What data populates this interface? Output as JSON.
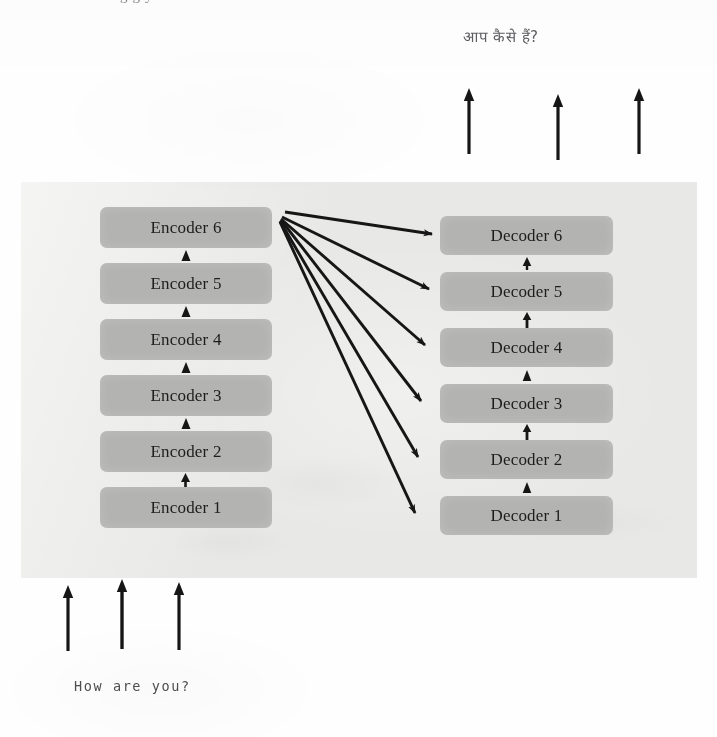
{
  "page": {
    "cutoff_text": "g      g  y",
    "width": 717,
    "height": 737
  },
  "output_sentence": {
    "text": "आप कैसे हैं?",
    "language": "Hindi",
    "meaning": "How are you?"
  },
  "input_sentence": {
    "text": "How are you?",
    "language": "English"
  },
  "colors": {
    "panel_background": "#e8e8e6",
    "block_fill": "#b3b3b2",
    "block_text": "#1d1d1d",
    "arrow": "#161616",
    "page_background": "#fefefe"
  },
  "diagram": {
    "type": "transformer-encoder-decoder-stack",
    "encoder_stack": {
      "label_prefix": "Encoder",
      "count": 6,
      "blocks": [
        {
          "label": "Encoder 6",
          "index": 6,
          "top": 0
        },
        {
          "label": "Encoder 5",
          "index": 5,
          "top": 56
        },
        {
          "label": "Encoder 4",
          "index": 4,
          "top": 112
        },
        {
          "label": "Encoder 3",
          "index": 3,
          "top": 168
        },
        {
          "label": "Encoder 2",
          "index": 2,
          "top": 224
        },
        {
          "label": "Encoder 1",
          "index": 1,
          "top": 280
        }
      ]
    },
    "decoder_stack": {
      "label_prefix": "Decoder",
      "count": 6,
      "blocks": [
        {
          "label": "Decoder 6",
          "index": 6,
          "top": 0
        },
        {
          "label": "Decoder 5",
          "index": 5,
          "top": 56
        },
        {
          "label": "Decoder 4",
          "index": 4,
          "top": 112
        },
        {
          "label": "Decoder 3",
          "index": 3,
          "top": 168
        },
        {
          "label": "Decoder 2",
          "index": 2,
          "top": 224
        },
        {
          "label": "Decoder 1",
          "index": 1,
          "top": 280
        }
      ]
    },
    "input_arrows": {
      "count": 3,
      "direction": "up",
      "positions_x": [
        67,
        121,
        178
      ],
      "top": 585,
      "length": 65
    },
    "output_arrows": {
      "count": 3,
      "direction": "up",
      "positions_x": [
        468,
        557,
        638
      ],
      "top": 88,
      "length": 64
    },
    "attention_arrows": {
      "count": 6,
      "source": "Encoder 6",
      "targets": [
        "Decoder 6",
        "Decoder 5",
        "Decoder 4",
        "Decoder 3",
        "Decoder 2",
        "Decoder 1"
      ],
      "origin": {
        "x": 283,
        "y": 216
      },
      "endpoints": [
        {
          "x": 435,
          "y": 235
        },
        {
          "x": 432,
          "y": 291
        },
        {
          "x": 428,
          "y": 347
        },
        {
          "x": 425,
          "y": 403
        },
        {
          "x": 422,
          "y": 459
        },
        {
          "x": 419,
          "y": 515
        }
      ]
    }
  }
}
